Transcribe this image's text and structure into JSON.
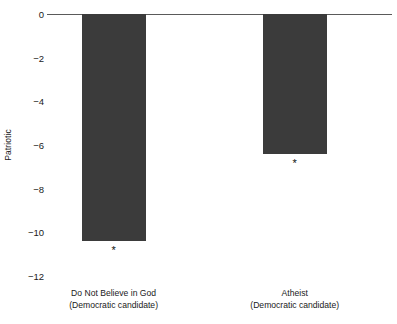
{
  "chart_data": {
    "type": "bar",
    "title": "",
    "subtitle": "",
    "xlabel": "",
    "ylabel": "Patriotic",
    "ylim": [
      -12,
      0
    ],
    "grid": false,
    "legend": "none",
    "orientation": "vertical",
    "bar_color": "#3b3b3b",
    "axis_color": "#5a5a5a",
    "categories": [
      "Do Not Believe in God\n(Democratic candidate)",
      "Atheist\n(Democratic candidate)"
    ],
    "category_lines": [
      [
        "Do Not Believe in God",
        "(Democratic candidate)"
      ],
      [
        "Atheist",
        "(Democratic candidate)"
      ]
    ],
    "values": [
      -10.4,
      -6.4
    ],
    "annotations": [
      "*",
      "*"
    ],
    "annotation_note": "asterisk below each bar denotes statistical significance",
    "yticks": [
      0,
      -2,
      -4,
      -6,
      -8,
      -10,
      -12
    ],
    "ytick_labels": [
      "0",
      "−2",
      "−4",
      "−6",
      "−8",
      "−10",
      "−12"
    ]
  },
  "axis": {
    "y_title": "Patriotic"
  }
}
